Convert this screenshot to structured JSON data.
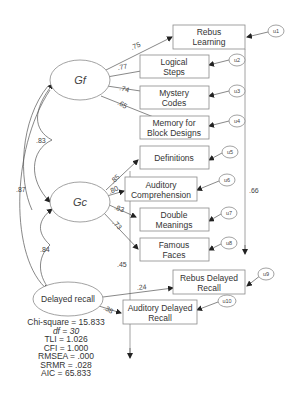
{
  "latents": {
    "gf": "Gf",
    "gc": "Gc",
    "delayed": "Delayed recall"
  },
  "indicators": [
    {
      "id": "rebus_learning",
      "line1": "Rebus",
      "line2": "Learning",
      "error": "u1",
      "loading": ".75"
    },
    {
      "id": "logical_steps",
      "line1": "Logical",
      "line2": "Steps",
      "error": "u2",
      "loading": ".77"
    },
    {
      "id": "mystery_codes",
      "line1": "Mystery",
      "line2": "Codes",
      "error": "u3",
      "loading": ".74"
    },
    {
      "id": "memory_block",
      "line1": "Memory for",
      "line2": "Block Designs",
      "error": "u4",
      "loading": ".65"
    },
    {
      "id": "definitions",
      "line1": "Definitions",
      "line2": "",
      "error": "u5",
      "loading": ".85"
    },
    {
      "id": "auditory_comp",
      "line1": "Auditory",
      "line2": "Comprehension",
      "error": "u6",
      "loading": ".80"
    },
    {
      "id": "double_meanings",
      "line1": "Double",
      "line2": "Meanings",
      "error": "u7",
      "loading": ".83"
    },
    {
      "id": "famous_faces",
      "line1": "Famous",
      "line2": "Faces",
      "error": "u8",
      "loading": ".73"
    },
    {
      "id": "rebus_delayed",
      "line1": "Rebus Delayed",
      "line2": "Recall",
      "error": "u9",
      "loading": ".24"
    },
    {
      "id": "auditory_delayed",
      "line1": "Auditory Delayed",
      "line2": "Recall",
      "error": "u10",
      "loading": ".38"
    }
  ],
  "correlations": {
    "gf_gc": ".83",
    "gf_delayed": ".87",
    "gc_delayed": ".84"
  },
  "cross_paths": {
    "rebus_learning_to_rebus_delayed": ".66",
    "auditory_comp_to_auditory_delayed": ".45"
  },
  "fit_stats": [
    "Chi-square = 15.833",
    "df = 30",
    "TLI = 1.026",
    "CFI = 1.000",
    "RMSEA = .000",
    "SRMR = .028",
    "AIC = 65.833"
  ]
}
